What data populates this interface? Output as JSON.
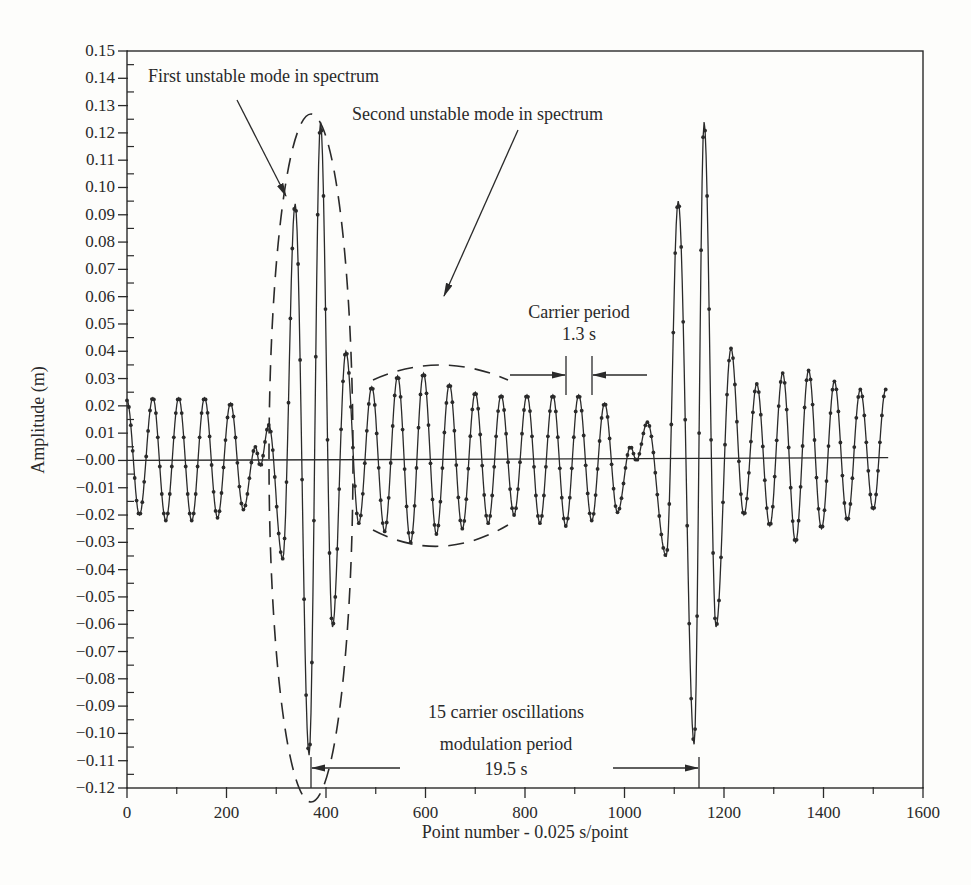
{
  "chart_data": {
    "type": "line",
    "title": "",
    "xlabel": "Point number - 0.025 s/point",
    "ylabel": "Amplitude (m)",
    "xlim": [
      0,
      1600
    ],
    "ylim": [
      -0.12,
      0.15
    ],
    "grid": false,
    "legend": null,
    "x_ticks": [
      0,
      200,
      400,
      600,
      800,
      1000,
      1200,
      1400,
      1600
    ],
    "x_tick_labels": [
      "0",
      "200",
      "400",
      "600",
      "800",
      "1000",
      "1200",
      "1400",
      "1600"
    ],
    "y_ticks": [
      0.15,
      0.14,
      0.13,
      0.12,
      0.11,
      0.1,
      0.09,
      0.08,
      0.07,
      0.06,
      0.05,
      0.04,
      0.03,
      0.02,
      0.01,
      0.0,
      -0.01,
      -0.02,
      -0.03,
      -0.04,
      -0.05,
      -0.06,
      -0.07,
      -0.08,
      -0.09,
      -0.1,
      -0.11,
      -0.12
    ],
    "y_tick_labels": [
      "0.15",
      "0.14",
      "0.13",
      "0.12",
      "0.11",
      "0.10",
      "0.09",
      "0.08",
      "0.07",
      "0.06",
      "0.05",
      "0.04",
      "0.03",
      "0.02",
      "0.01",
      "-0.00",
      "-0.01",
      "-0.02",
      "-0.03",
      "-0.04",
      "-0.05",
      "-0.06",
      "-0.07",
      "-0.08",
      "-0.09",
      "-0.10",
      "-0.11",
      "-0.12"
    ],
    "series": [
      {
        "name": "Amplitude time series (dotted markers)",
        "marker": "dot",
        "description": "Carrier oscillation ~52 points (1.3 s) period, modulated with period ~780 points (19.5 s); large bursts near points 330-420 and 1110-1200",
        "extrema": [
          {
            "x": 0,
            "y": 0.022
          },
          {
            "x": 25,
            "y": -0.02
          },
          {
            "x": 52,
            "y": 0.023
          },
          {
            "x": 78,
            "y": -0.022
          },
          {
            "x": 104,
            "y": 0.023
          },
          {
            "x": 130,
            "y": -0.022
          },
          {
            "x": 156,
            "y": 0.023
          },
          {
            "x": 182,
            "y": -0.021
          },
          {
            "x": 208,
            "y": 0.021
          },
          {
            "x": 234,
            "y": -0.018
          },
          {
            "x": 258,
            "y": 0.005
          },
          {
            "x": 268,
            "y": -0.002
          },
          {
            "x": 285,
            "y": 0.013
          },
          {
            "x": 313,
            "y": -0.036
          },
          {
            "x": 338,
            "y": 0.094
          },
          {
            "x": 366,
            "y": -0.108
          },
          {
            "x": 389,
            "y": 0.124
          },
          {
            "x": 413,
            "y": -0.061
          },
          {
            "x": 440,
            "y": 0.04
          },
          {
            "x": 466,
            "y": -0.023
          },
          {
            "x": 492,
            "y": 0.027
          },
          {
            "x": 518,
            "y": -0.026
          },
          {
            "x": 544,
            "y": 0.031
          },
          {
            "x": 570,
            "y": -0.03
          },
          {
            "x": 596,
            "y": 0.032
          },
          {
            "x": 622,
            "y": -0.027
          },
          {
            "x": 648,
            "y": 0.028
          },
          {
            "x": 674,
            "y": -0.025
          },
          {
            "x": 700,
            "y": 0.025
          },
          {
            "x": 726,
            "y": -0.023
          },
          {
            "x": 752,
            "y": 0.024
          },
          {
            "x": 778,
            "y": -0.02
          },
          {
            "x": 804,
            "y": 0.024
          },
          {
            "x": 830,
            "y": -0.023
          },
          {
            "x": 856,
            "y": 0.024
          },
          {
            "x": 882,
            "y": -0.024
          },
          {
            "x": 908,
            "y": 0.024
          },
          {
            "x": 934,
            "y": -0.022
          },
          {
            "x": 960,
            "y": 0.021
          },
          {
            "x": 986,
            "y": -0.019
          },
          {
            "x": 1012,
            "y": 0.005
          },
          {
            "x": 1024,
            "y": 0.0
          },
          {
            "x": 1046,
            "y": 0.014
          },
          {
            "x": 1084,
            "y": -0.035
          },
          {
            "x": 1108,
            "y": 0.095
          },
          {
            "x": 1140,
            "y": -0.104
          },
          {
            "x": 1160,
            "y": 0.124
          },
          {
            "x": 1184,
            "y": -0.061
          },
          {
            "x": 1214,
            "y": 0.041
          },
          {
            "x": 1240,
            "y": -0.02
          },
          {
            "x": 1266,
            "y": 0.028
          },
          {
            "x": 1292,
            "y": -0.024
          },
          {
            "x": 1318,
            "y": 0.032
          },
          {
            "x": 1344,
            "y": -0.03
          },
          {
            "x": 1370,
            "y": 0.033
          },
          {
            "x": 1396,
            "y": -0.025
          },
          {
            "x": 1422,
            "y": 0.029
          },
          {
            "x": 1448,
            "y": -0.022
          },
          {
            "x": 1474,
            "y": 0.026
          },
          {
            "x": 1500,
            "y": -0.018
          },
          {
            "x": 1525,
            "y": 0.026
          }
        ]
      }
    ],
    "annotations": [
      {
        "text": "First unstable mode in spectrum",
        "arrow_to": {
          "x": 310,
          "y": 0.095
        }
      },
      {
        "text": "Second unstable mode in spectrum",
        "arrow_to": {
          "x": 605,
          "y": 0.034
        }
      },
      {
        "text": "Carrier period",
        "subtext": "1.3 s",
        "span": [
          880,
          932
        ],
        "at_y": 0.024
      },
      {
        "text": "15 carrier oscillations",
        "subtext_1": "modulation period",
        "subtext_2": "19.5 s",
        "span": [
          366,
          1140
        ],
        "at_y": -0.114
      },
      {
        "shape": "dashed-ellipse",
        "label": "first mode envelope",
        "center": {
          "x": 365,
          "y": 0.01
        },
        "x_extent": [
          285,
          440
        ],
        "y_extent": [
          -0.108,
          0.127
        ]
      },
      {
        "shape": "dashed-envelope",
        "label": "second mode envelope",
        "x_range": [
          460,
          780
        ],
        "upper_peak": 0.033,
        "lower_peak": -0.033
      }
    ]
  },
  "labels": {
    "xlabel": "Point number - 0.025 s/point",
    "ylabel": "Amplitude (m)",
    "annot_first": "First unstable mode in spectrum",
    "annot_second": "Second unstable mode in spectrum",
    "annot_carrier_1": "Carrier period",
    "annot_carrier_2": "1.3 s",
    "annot_mod_1": "15 carrier oscillations",
    "annot_mod_2": "modulation period",
    "annot_mod_3": "19.5 s"
  },
  "colors": {
    "ink": "#2a2a2a",
    "background": "#fdfdfb"
  }
}
